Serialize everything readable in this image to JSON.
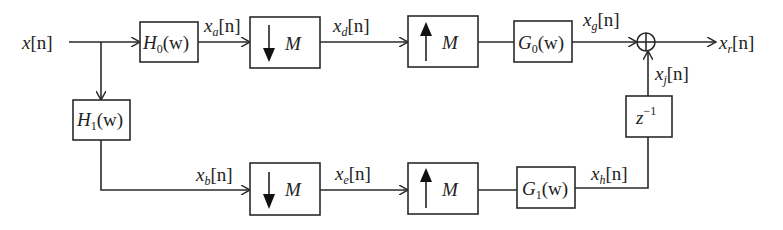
{
  "diagram": {
    "type": "two-channel filter bank block diagram",
    "input": {
      "var": "x",
      "arg": "[n]"
    },
    "output": {
      "var": "x",
      "sub": "r",
      "arg": "[n]"
    },
    "top_branch": {
      "analysis_filter": {
        "name": "H",
        "sub": "0",
        "arg": "(w)"
      },
      "signal_after_analysis": {
        "var": "x",
        "sub": "a",
        "arg": "[n]"
      },
      "downsampler": {
        "arrow": "down",
        "factor": "M"
      },
      "signal_after_down": {
        "var": "x",
        "sub": "d",
        "arg": "[n]"
      },
      "upsampler": {
        "arrow": "up",
        "factor": "M"
      },
      "synthesis_filter": {
        "name": "G",
        "sub": "0",
        "arg": "(w)"
      },
      "signal_after_synthesis": {
        "var": "x",
        "sub": "g",
        "arg": "[n]"
      }
    },
    "bottom_branch": {
      "analysis_filter": {
        "name": "H",
        "sub": "1",
        "arg": "(w)"
      },
      "signal_after_analysis": {
        "var": "x",
        "sub": "b",
        "arg": "[n]"
      },
      "downsampler": {
        "arrow": "down",
        "factor": "M"
      },
      "signal_after_down": {
        "var": "x",
        "sub": "e",
        "arg": "[n]"
      },
      "upsampler": {
        "arrow": "up",
        "factor": "M"
      },
      "synthesis_filter": {
        "name": "G",
        "sub": "1",
        "arg": "(w)"
      },
      "signal_after_synthesis": {
        "var": "x",
        "sub": "h",
        "arg": "[n]"
      }
    },
    "delay": {
      "base": "z",
      "exp": "−1"
    },
    "signal_after_delay": {
      "var": "x",
      "sub": "j",
      "arg": "[n]"
    },
    "adder": {
      "symbol": "⊕"
    }
  }
}
